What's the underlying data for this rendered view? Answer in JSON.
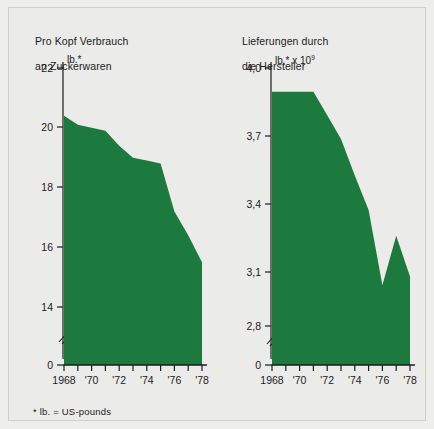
{
  "figure": {
    "background_color": "#eeeeec",
    "series_color": "#1d7a3e",
    "axis_color": "#1b1b1b",
    "footnote": "* lb. = US-pounds"
  },
  "chart_data": [
    {
      "type": "area",
      "panel": "left",
      "title": "Pro Kopf Verbrauch\nan Zuckerwaren",
      "title_line1": "Pro Kopf Verbrauch",
      "title_line2": "an Zuckerwaren",
      "unit_label": "lb.*",
      "unit_prefix": "lb.*",
      "unit_exponent": "",
      "xlabel": "",
      "ylabel": "lb.*",
      "grid": false,
      "legend": "none",
      "axis_break": true,
      "ylim": [
        0,
        22
      ],
      "yticks": [
        0,
        14,
        16,
        18,
        20,
        22
      ],
      "ytick_labels": [
        "0",
        "14",
        "16",
        "18",
        "20",
        "22"
      ],
      "x": [
        1968,
        1969,
        1970,
        1971,
        1972,
        1973,
        1974,
        1975,
        1976,
        1977,
        1978
      ],
      "xticks": [
        1968,
        1969,
        1970,
        1971,
        1972,
        1973,
        1974,
        1975,
        1976,
        1977,
        1978
      ],
      "xtick_labels": [
        "1968",
        "",
        "'70",
        "",
        "'72",
        "",
        "'74",
        "",
        "'76",
        "",
        "'78"
      ],
      "values": [
        20.4,
        20.1,
        20.0,
        19.9,
        19.4,
        19.0,
        18.9,
        18.8,
        17.2,
        16.4,
        15.5
      ],
      "categories": [
        "1968",
        "1969",
        "1970",
        "1971",
        "1972",
        "1973",
        "1974",
        "1975",
        "1976",
        "1977",
        "1978"
      ]
    },
    {
      "type": "area",
      "panel": "right",
      "title": "Lieferungen durch\ndie Hersteller",
      "title_line1": "Lieferungen durch",
      "title_line2": "die Hersteller",
      "unit_label": "lb.* x 10⁹",
      "unit_prefix": "lb.* x 10",
      "unit_exponent": "9",
      "xlabel": "",
      "ylabel": "lb.* x 10⁹",
      "grid": false,
      "legend": "none",
      "axis_break": true,
      "ylim": [
        0,
        4.0
      ],
      "yticks": [
        0,
        2.8,
        3.1,
        3.4,
        3.7,
        4.0
      ],
      "ytick_labels": [
        "0",
        "2,8",
        "3,1",
        "3,4",
        "3,7",
        "4,0"
      ],
      "x": [
        1968,
        1969,
        1970,
        1971,
        1972,
        1973,
        1974,
        1975,
        1976,
        1977,
        1978
      ],
      "xticks": [
        1968,
        1969,
        1970,
        1971,
        1972,
        1973,
        1974,
        1975,
        1976,
        1977,
        1978
      ],
      "xtick_labels": [
        "1968",
        "",
        "'70",
        "",
        "'72",
        "",
        "'74",
        "",
        "'76",
        "",
        "'78"
      ],
      "values": [
        3.89,
        3.89,
        3.89,
        3.89,
        3.78,
        3.67,
        3.5,
        3.34,
        2.99,
        3.22,
        3.03
      ],
      "categories": [
        "1968",
        "1969",
        "1970",
        "1971",
        "1972",
        "1973",
        "1974",
        "1975",
        "1976",
        "1977",
        "1978"
      ]
    }
  ]
}
